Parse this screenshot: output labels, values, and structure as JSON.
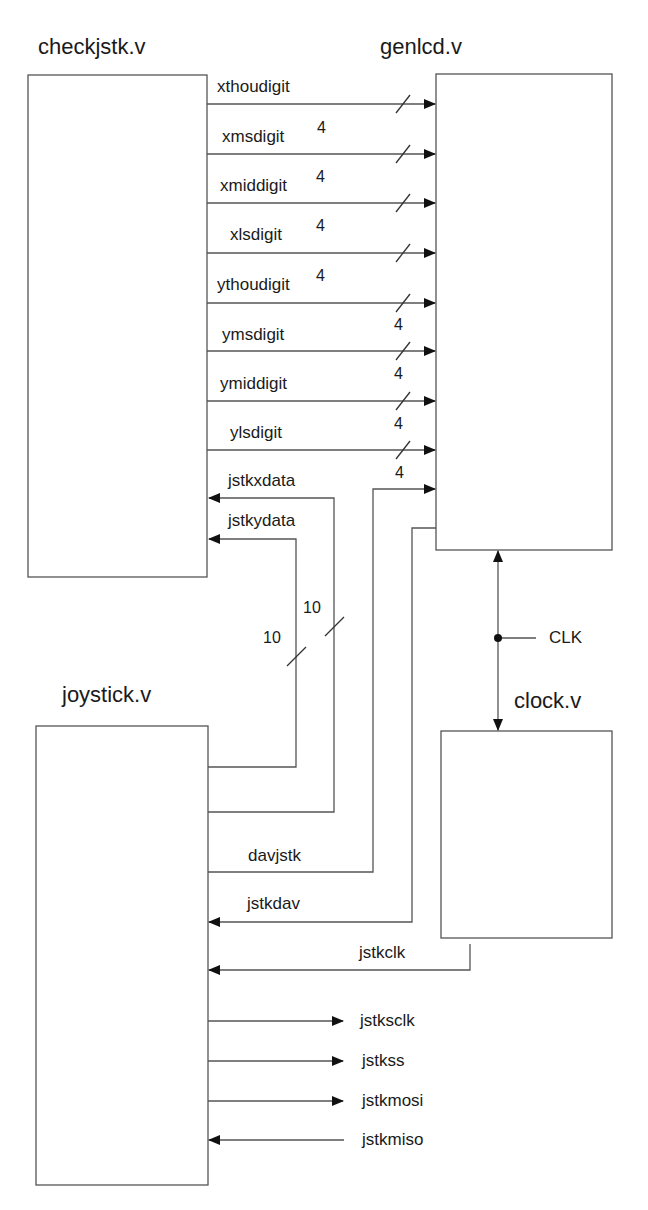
{
  "modules": {
    "checkjstk": "checkjstk.v",
    "genlcd": "genlcd.v",
    "joystick": "joystick.v",
    "clock": "clock.v"
  },
  "buses": [
    {
      "name": "xthoudigit",
      "width": "4"
    },
    {
      "name": "xmsdigit",
      "width": "4"
    },
    {
      "name": "xmiddigit",
      "width": "4"
    },
    {
      "name": "xlsdigit",
      "width": "4"
    },
    {
      "name": "ythoudigit",
      "width": "4"
    },
    {
      "name": "ymsdigit",
      "width": "4"
    },
    {
      "name": "ymiddigit",
      "width": "4"
    },
    {
      "name": "ylsdigit",
      "width": "4"
    }
  ],
  "joystick_to_check": [
    {
      "name": "jstkxdata",
      "width": "10"
    },
    {
      "name": "jstkydata",
      "width": "10"
    }
  ],
  "signals": {
    "davjstk": "davjstk",
    "jstkdav": "jstkdav",
    "jstkclk": "jstkclk",
    "clk": "CLK"
  },
  "ports": [
    {
      "name": "jstksclk",
      "dir": "out"
    },
    {
      "name": "jstkss",
      "dir": "out"
    },
    {
      "name": "jstkmosi",
      "dir": "out"
    },
    {
      "name": "jstkmiso",
      "dir": "in"
    }
  ]
}
